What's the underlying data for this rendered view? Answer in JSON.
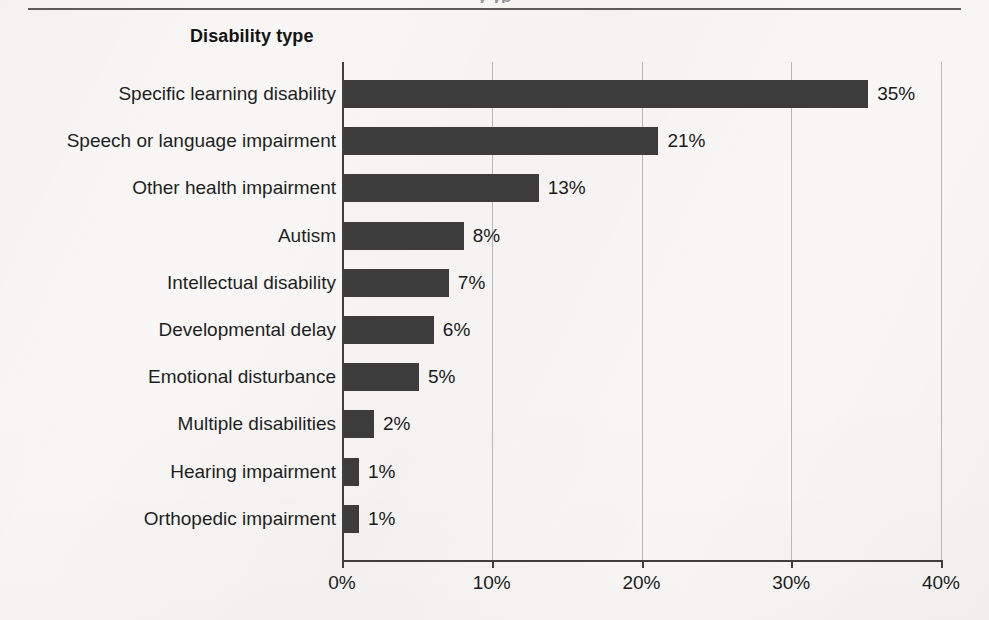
{
  "page": {
    "top_bleed_text": "y  yp",
    "background_color": "#f8f7f5",
    "bar_color": "#3c3c3c",
    "axis_color": "#3f3f3f",
    "gridline_color": "#b9b9b9"
  },
  "chart_data": {
    "type": "bar",
    "orientation": "horizontal",
    "title": "",
    "axis_title": "Disability type",
    "xlabel": "",
    "ylabel": "",
    "xlim": [
      0,
      40
    ],
    "grid": true,
    "legend": "none",
    "xticks": [
      "0%",
      "10%",
      "20%",
      "30%",
      "40%"
    ],
    "xtick_values": [
      0,
      10,
      20,
      30,
      40
    ],
    "categories": [
      "Specific learning disability",
      "Speech or language impairment",
      "Other health impairment",
      "Autism",
      "Intellectual disability",
      "Developmental delay",
      "Emotional disturbance",
      "Multiple disabilities",
      "Hearing impairment",
      "Orthopedic impairment"
    ],
    "values": [
      35,
      21,
      13,
      8,
      7,
      6,
      5,
      2,
      1,
      1
    ],
    "data_labels": [
      "35%",
      "21%",
      "13%",
      "8%",
      "7%",
      "6%",
      "5%",
      "2%",
      "1%",
      "1%"
    ]
  }
}
